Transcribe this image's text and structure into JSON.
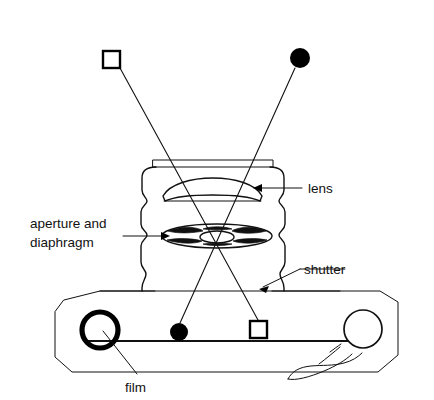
{
  "figure": {
    "type": "line-diagram"
  },
  "labels": {
    "lens": "lens",
    "aperture_line1": "aperture and",
    "aperture_line2": "diaphragm",
    "shutter": "shutter",
    "film": "film"
  },
  "icons": {
    "object_square": "open-square-marker",
    "object_circle": "filled-circle-marker",
    "image_square": "open-square-marker",
    "image_circle": "filled-circle-marker",
    "arrow_lens": "left-pointing-arrow",
    "arrow_aperture": "right-pointing-arrow",
    "arrow_shutter": "down-left-pointing-arrow",
    "leader_film": "leader-line"
  },
  "colors": {
    "ink": "#111111",
    "fill": "#000000",
    "background": "#ffffff"
  },
  "markers": {
    "object_square": {
      "x": 111,
      "y": 59,
      "size": 17
    },
    "object_circle": {
      "x": 300,
      "y": 58,
      "r": 10
    },
    "image_circle": {
      "x": 179,
      "y": 332,
      "r": 9
    },
    "image_square": {
      "x": 258,
      "y": 329,
      "size": 17
    }
  },
  "optics": {
    "crossing_point": {
      "x": 218,
      "y": 247
    },
    "lens_center": {
      "x": 213,
      "y": 188
    },
    "aperture_center": {
      "x": 217,
      "y": 236
    },
    "film_plane_y": 341
  },
  "parts": [
    {
      "name": "lens",
      "label": "lens"
    },
    {
      "name": "aperture-and-diaphragm",
      "label": "aperture and diaphragm"
    },
    {
      "name": "shutter",
      "label": "shutter"
    },
    {
      "name": "film",
      "label": "film"
    }
  ]
}
